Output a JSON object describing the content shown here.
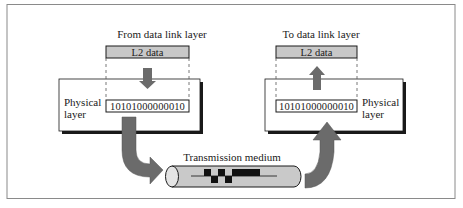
{
  "diagram": {
    "colors": {
      "frame_border": "#8a8a8a",
      "box_border": "#1a1a1a",
      "l2_fill": "#c8c8c8",
      "arrow_fill": "#6b6b6b",
      "cable_fill": "#c9c9c9",
      "signal_fill": "#111111",
      "shadow": "#1a1a1a"
    },
    "sender": {
      "top_label": "From data link layer",
      "l2_box_label": "L2 data",
      "layer_label_line1": "Physical",
      "layer_label_line2": "layer",
      "bits": "10101000000010",
      "arrow_direction": "down"
    },
    "receiver": {
      "top_label": "To data link layer",
      "l2_box_label": "L2 data",
      "layer_label_line1": "Physical",
      "layer_label_line2": "layer",
      "bits": "10101000000010",
      "arrow_direction": "up"
    },
    "medium": {
      "label": "Transmission medium",
      "signal_bits": "10101000000010"
    }
  }
}
